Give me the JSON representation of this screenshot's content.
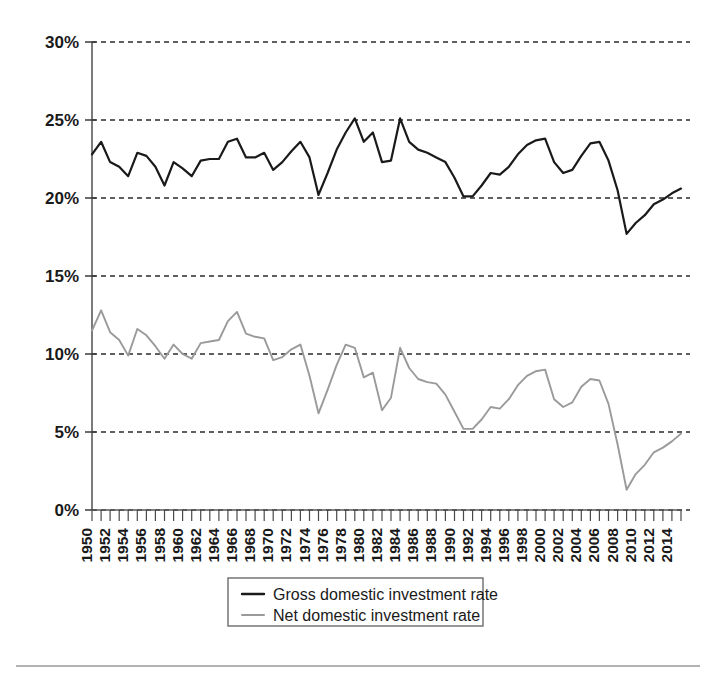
{
  "chart_data": {
    "type": "line",
    "title": "",
    "subtitle": "",
    "xlabel": "",
    "ylabel": "",
    "xlim": [
      1950,
      2015
    ],
    "ylim": [
      0,
      30
    ],
    "yticks": [
      0,
      5,
      10,
      15,
      20,
      25,
      30
    ],
    "ytick_labels": [
      "0%",
      "5%",
      "10%",
      "15%",
      "20%",
      "25%",
      "30%"
    ],
    "grid": "horizontal-dashed",
    "legend_position": "bottom-center",
    "x": [
      1950,
      1951,
      1952,
      1953,
      1954,
      1955,
      1956,
      1957,
      1958,
      1959,
      1960,
      1961,
      1962,
      1963,
      1964,
      1965,
      1966,
      1967,
      1968,
      1969,
      1970,
      1971,
      1972,
      1973,
      1974,
      1975,
      1976,
      1977,
      1978,
      1979,
      1980,
      1981,
      1982,
      1983,
      1984,
      1985,
      1986,
      1987,
      1988,
      1989,
      1990,
      1991,
      1992,
      1993,
      1994,
      1995,
      1996,
      1997,
      1998,
      1999,
      2000,
      2001,
      2002,
      2003,
      2004,
      2005,
      2006,
      2007,
      2008,
      2009,
      2010,
      2011,
      2012,
      2013,
      2014,
      2015
    ],
    "xtick_labels": [
      "1950",
      "1952",
      "1954",
      "1956",
      "1958",
      "1960",
      "1962",
      "1964",
      "1966",
      "1968",
      "1970",
      "1972",
      "1974",
      "1976",
      "1978",
      "1980",
      "1982",
      "1984",
      "1986",
      "1988",
      "1990",
      "1992",
      "1994",
      "1996",
      "1998",
      "2000",
      "2002",
      "2004",
      "2006",
      "2008",
      "2010",
      "2012",
      "2014"
    ],
    "xtick_step_years": 2,
    "series": [
      {
        "name": "Gross domestic investment rate",
        "color": "#1a1a1a",
        "width": 2.2,
        "values": [
          22.8,
          23.6,
          22.3,
          22.0,
          21.4,
          22.9,
          22.7,
          22.0,
          20.8,
          22.3,
          21.9,
          21.4,
          22.4,
          22.5,
          22.5,
          23.6,
          23.8,
          22.6,
          22.6,
          22.9,
          21.8,
          22.3,
          23.0,
          23.6,
          22.6,
          20.2,
          21.6,
          23.1,
          24.2,
          25.1,
          23.6,
          24.2,
          22.3,
          22.4,
          25.1,
          23.6,
          23.1,
          22.9,
          22.6,
          22.3,
          21.3,
          20.1,
          20.1,
          20.8,
          21.6,
          21.5,
          22.0,
          22.8,
          23.4,
          23.7,
          23.8,
          22.3,
          21.6,
          21.8,
          22.7,
          23.5,
          23.6,
          22.4,
          20.5,
          17.7,
          18.4,
          18.9,
          19.6,
          19.9,
          20.3,
          20.6
        ]
      },
      {
        "name": "Net domestic investment rate",
        "color": "#9a9a9a",
        "width": 1.9,
        "values": [
          11.5,
          12.8,
          11.4,
          10.9,
          9.9,
          11.6,
          11.2,
          10.5,
          9.7,
          10.6,
          10.0,
          9.7,
          10.7,
          10.8,
          10.9,
          12.1,
          12.7,
          11.3,
          11.1,
          11.0,
          9.6,
          9.8,
          10.3,
          10.6,
          8.6,
          6.2,
          7.7,
          9.3,
          10.6,
          10.4,
          8.5,
          8.8,
          6.4,
          7.2,
          10.4,
          9.1,
          8.4,
          8.2,
          8.1,
          7.4,
          6.3,
          5.2,
          5.2,
          5.8,
          6.6,
          6.5,
          7.1,
          8.0,
          8.6,
          8.9,
          9.0,
          7.1,
          6.6,
          6.9,
          7.9,
          8.4,
          8.3,
          6.8,
          4.2,
          1.3,
          2.3,
          2.9,
          3.7,
          4.0,
          4.4,
          4.9
        ]
      }
    ]
  },
  "legend": {
    "items": [
      {
        "label": "Gross domestic investment rate",
        "color": "#1a1a1a"
      },
      {
        "label": "Net domestic investment rate",
        "color": "#9a9a9a"
      }
    ]
  },
  "colors": {
    "gross": "#1a1a1a",
    "net": "#9a9a9a",
    "grid": "#2b2b2b",
    "axis": "#5a5a5a",
    "background": "#ffffff"
  }
}
